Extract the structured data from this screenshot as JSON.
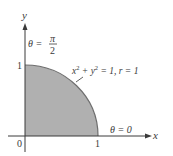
{
  "diagram": {
    "type": "quarter-disk-polar-region",
    "axes": {
      "x_label": "x",
      "y_label": "y",
      "origin_label": "0",
      "x_tick_label": "1",
      "y_tick_label": "1"
    },
    "annotations": {
      "theta_top": {
        "lhs": "θ =",
        "num": "π",
        "den": "2"
      },
      "theta_right": "θ = 0",
      "circle_eq_x": "x",
      "circle_eq_sup1": "2",
      "circle_eq_plus": " + y",
      "circle_eq_sup2": "2",
      "circle_eq_rest": " = 1, r = 1"
    },
    "colors": {
      "fill": "#b0b0b0",
      "arc": "#6e6e6e",
      "axis": "#3a3a3a",
      "text": "#3a3a3a"
    }
  }
}
